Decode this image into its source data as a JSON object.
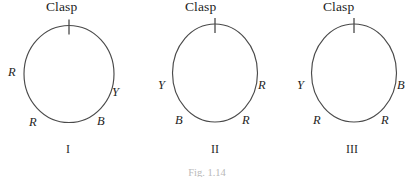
{
  "figure": {
    "caption": "Fig. 1.14",
    "clasp_label": "Clasp",
    "stroke_color": "#4a4a4a",
    "diagrams": [
      {
        "numeral": "I",
        "clasp": "Clasp",
        "beads": [
          {
            "label": "R",
            "position": "left-middle"
          },
          {
            "label": "Y",
            "position": "right-lower"
          },
          {
            "label": "R",
            "position": "bottom-left"
          },
          {
            "label": "B",
            "position": "bottom-right"
          }
        ]
      },
      {
        "numeral": "II",
        "clasp": "Clasp",
        "beads": [
          {
            "label": "Y",
            "position": "left-middle"
          },
          {
            "label": "R",
            "position": "right-middle"
          },
          {
            "label": "B",
            "position": "bottom-left"
          },
          {
            "label": "R",
            "position": "bottom-right"
          }
        ]
      },
      {
        "numeral": "III",
        "clasp": "Clasp",
        "beads": [
          {
            "label": "Y",
            "position": "left-middle"
          },
          {
            "label": "B",
            "position": "right-middle"
          },
          {
            "label": "R",
            "position": "bottom-left"
          },
          {
            "label": "R",
            "position": "bottom-right"
          }
        ]
      }
    ]
  }
}
